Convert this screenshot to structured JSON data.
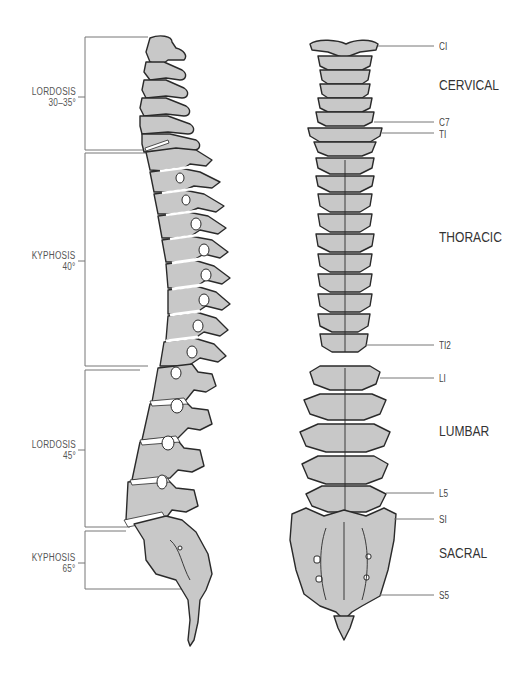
{
  "diagram": {
    "colors": {
      "bone_fill": "#c8c8c8",
      "outline": "#2a2a2a",
      "disc": "#ffffff",
      "leader_line": "#777777",
      "text": "#444444"
    }
  },
  "lateral_view": {
    "curves": [
      {
        "name": "LORDOSIS",
        "angle": "30–35°",
        "region": "cervical"
      },
      {
        "name": "KYPHOSIS",
        "angle": "40°",
        "region": "thoracic"
      },
      {
        "name": "LORDOSIS",
        "angle": "45°",
        "region": "lumbar"
      },
      {
        "name": "KYPHOSIS",
        "angle": "65°",
        "region": "sacral"
      }
    ]
  },
  "posterior_view": {
    "levels": [
      {
        "label": "CI"
      },
      {
        "label": "C7"
      },
      {
        "label": "TI"
      },
      {
        "label": "TI2"
      },
      {
        "label": "LI"
      },
      {
        "label": "L5"
      },
      {
        "label": "SI"
      },
      {
        "label": "S5"
      }
    ],
    "regions": [
      {
        "label": "CERVICAL"
      },
      {
        "label": "THORACIC"
      },
      {
        "label": "LUMBAR"
      },
      {
        "label": "SACRAL"
      }
    ]
  }
}
